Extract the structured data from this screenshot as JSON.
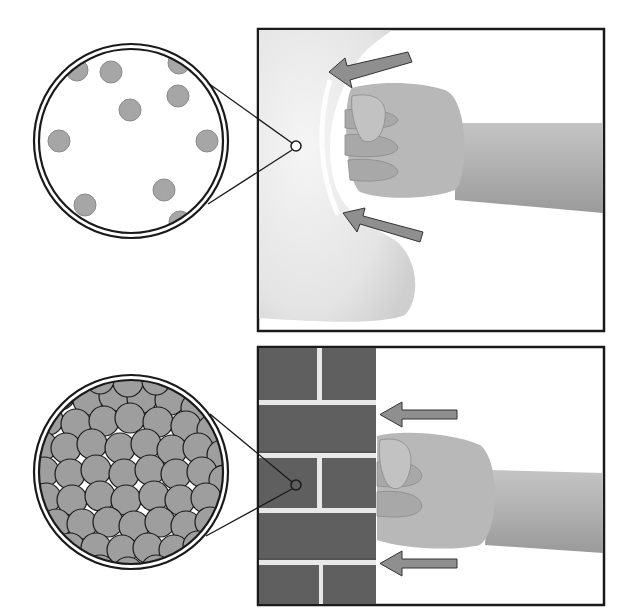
{
  "figure": {
    "panels": [
      {
        "id": "pillow",
        "subject": "fist-punching-pillow",
        "magnified_view": "sparse-particles",
        "arrow_count": 2
      },
      {
        "id": "brick-wall",
        "subject": "fist-punching-brick-wall",
        "magnified_view": "densely-packed-particles",
        "arrow_count": 2
      }
    ],
    "colors": {
      "frame": "#1a1a1a",
      "particle": "#a6a6a6",
      "arrow": "#8f8f8f",
      "brick": "#5f5f5f",
      "mortar": "#e8e8e8",
      "skin": "#b5b5b5",
      "pillow": "#e6e6e6"
    }
  }
}
